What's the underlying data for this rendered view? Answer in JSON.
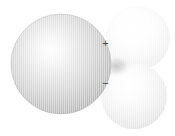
{
  "figure": {
    "background_color": "#ffffff",
    "texture": "vertical-line-screen",
    "canvas": {
      "width": 175,
      "height": 136
    }
  },
  "spheres": [
    {
      "id": "central-sphere",
      "name": "large-left-sphere",
      "cx": 61,
      "cy": 64,
      "r": 50,
      "highlight_x": 50,
      "highlight_y": 46,
      "tone": "medium-gray",
      "edge_color": "#8f8f8f",
      "mid_color": "#c9c9c9",
      "highlight_color": "#fdfdfd"
    },
    {
      "id": "upper-lobe-sphere",
      "name": "top-right-sphere",
      "cx": 138,
      "cy": 38,
      "r": 32,
      "highlight_x": 132,
      "highlight_y": 28,
      "tone": "very-light-gray",
      "edge_color": "#d8d8d8",
      "mid_color": "#f0f0f0",
      "highlight_color": "#ffffff"
    },
    {
      "id": "lower-lobe-sphere",
      "name": "bottom-right-sphere",
      "cx": 134,
      "cy": 96,
      "r": 33,
      "highlight_x": 128,
      "highlight_y": 88,
      "tone": "light-gray",
      "edge_color": "#c6c6c6",
      "mid_color": "#e6e6e6",
      "highlight_color": "#ffffff"
    }
  ],
  "labels": {
    "positive_charge": "+",
    "negative_charge": "−",
    "label_color": "#4a4a4a"
  },
  "colors": {
    "background": "#ffffff",
    "stroke_dark": "#8f8f8f",
    "stroke_light": "#d8d8d8",
    "text": "#4a4a4a"
  }
}
